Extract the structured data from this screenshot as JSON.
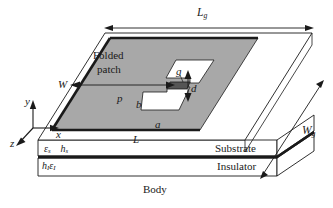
{
  "figure": {
    "type": "diagram",
    "background_color": "#ffffff",
    "patch_fill": "#a8a8a8",
    "slot_fill": "#ffffff",
    "feed_fill": "#555555",
    "line_color": "#1a1a1a"
  },
  "labels": {
    "lg": "L",
    "lg_sub": "g",
    "wg": "W",
    "wg_sub": "g",
    "w": "W",
    "l": "L",
    "p": "p",
    "a": "a",
    "b": "b",
    "g": "g",
    "d": "d",
    "folded_patch_line1": "Folded",
    "folded_patch_line2": "patch",
    "substrate": "Substrate",
    "insulator": "Insulator",
    "body": "Body",
    "eps_s": "ε",
    "eps_s_sub": "s",
    "h_s": "h",
    "h_s_sub": "s",
    "h_i": "h",
    "h_i_sub": "I",
    "eps_i": "ε",
    "eps_i_sub": "I"
  },
  "axes": {
    "x": "x",
    "y": "y",
    "z": "z"
  }
}
